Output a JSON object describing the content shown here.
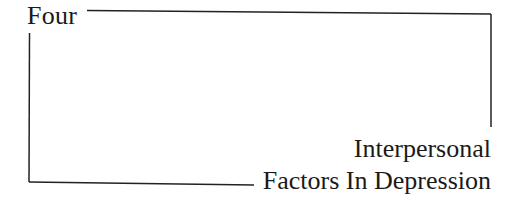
{
  "chapter": {
    "label": "Four"
  },
  "title": {
    "lines": [
      "Interpersonal",
      "Factors In Depression"
    ]
  },
  "style": {
    "rule_color": "#222222",
    "text_color": "#1a1a1a"
  }
}
